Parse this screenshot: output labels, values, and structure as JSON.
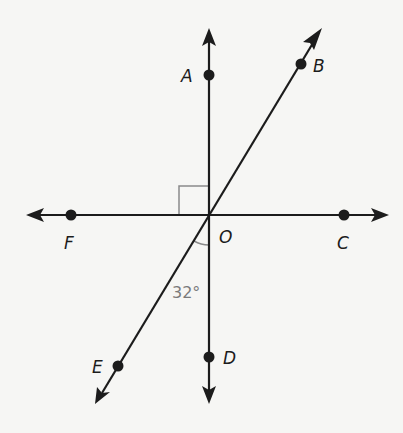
{
  "diagram": {
    "center_label": "O",
    "points": [
      {
        "id": "A",
        "label": "A"
      },
      {
        "id": "B",
        "label": "B"
      },
      {
        "id": "C",
        "label": "C"
      },
      {
        "id": "D",
        "label": "D"
      },
      {
        "id": "E",
        "label": "E"
      },
      {
        "id": "F",
        "label": "F"
      }
    ],
    "lines": [
      {
        "name": "line-AD",
        "through": [
          "A",
          "D"
        ],
        "direction": "vertical"
      },
      {
        "name": "line-FC",
        "through": [
          "F",
          "C"
        ],
        "direction": "horizontal"
      },
      {
        "name": "line-EB",
        "through": [
          "E",
          "B"
        ],
        "direction": "diagonal"
      }
    ],
    "right_angle_mark": "angle AOF",
    "angle_marks": [
      {
        "between": [
          "D",
          "E"
        ],
        "label": "32°",
        "value_deg": 32
      }
    ]
  }
}
